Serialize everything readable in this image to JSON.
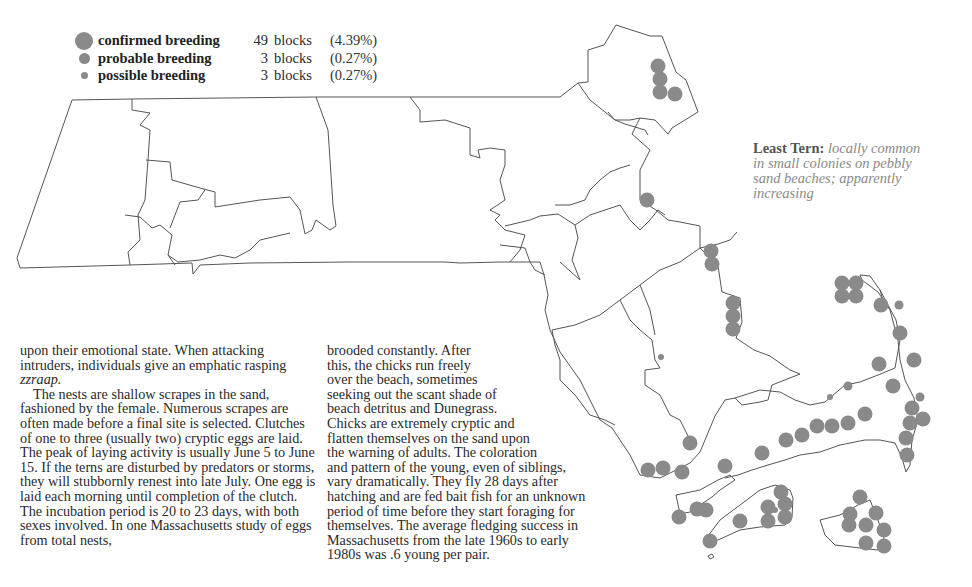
{
  "legend": {
    "dot_color": "#8a8a8a",
    "rows": [
      {
        "label": "confirmed breeding",
        "count": "49",
        "unit": "blocks",
        "percent": "(4.39%)",
        "dot_size": 18
      },
      {
        "label": "probable breeding",
        "count": "3",
        "unit": "blocks",
        "percent": "(0.27%)",
        "dot_size": 11
      },
      {
        "label": "possible breeding",
        "count": "3",
        "unit": "blocks",
        "percent": "(0.27%)",
        "dot_size": 7
      }
    ]
  },
  "species": {
    "name": "Least Tern:",
    "description": " locally common in small colonies on pebbly sand beaches; apparently increasing"
  },
  "text": {
    "left_p1_a": "upon their emotional state. When attacking intruders, individuals give an emphatic rasping ",
    "left_p1_em": "zzraap.",
    "left_p2": "The nests are shallow scrapes in the sand, fashioned by the female. Numerous scrapes are often made before a final site is selected. Clutches of one to three (usually two) cryptic eggs are laid. The peak of laying activity is usually June 5 to June 15. If the terns are disturbed by predators or storms, they will stubbornly renest into late July. One egg is laid each morning until completion of the clutch. The incubation period is 20 to 23 days, with both sexes involved. In one Massachusetts study of eggs from total nests,",
    "mid_lines": [
      "brooded constantly. After",
      "this, the chicks run freely",
      "over the beach, sometimes",
      "seeking out the scant shade of",
      "beach detritus and Dunegrass.",
      "Chicks are extremely cryptic and",
      "flatten themselves on the sand upon",
      "the warning of adults. The coloration",
      "and pattern of the young, even of siblings,",
      "vary dramatically. They fly 28 days after",
      "hatching and are fed bait fish for an unknown",
      "period of time before they start foraging for",
      "themselves. The average fledging success in",
      "Massachusetts from the late 1960s to early",
      "1980s was .6 young per pair."
    ]
  },
  "map": {
    "outline_color": "#555555",
    "dot_color": "#8a8a8a",
    "confirmed_dots": [
      [
        658,
        66
      ],
      [
        660,
        79
      ],
      [
        660,
        92
      ],
      [
        675,
        94
      ],
      [
        647,
        200
      ],
      [
        711,
        251
      ],
      [
        712,
        264
      ],
      [
        733,
        303
      ],
      [
        733,
        316
      ],
      [
        733,
        329
      ],
      [
        842,
        283
      ],
      [
        856,
        283
      ],
      [
        842,
        296
      ],
      [
        856,
        296
      ],
      [
        881,
        305
      ],
      [
        900,
        333
      ],
      [
        914,
        360
      ],
      [
        879,
        364
      ],
      [
        912,
        408
      ],
      [
        910,
        423
      ],
      [
        923,
        419
      ],
      [
        906,
        438
      ],
      [
        907,
        455
      ],
      [
        893,
        386
      ],
      [
        865,
        414
      ],
      [
        848,
        423
      ],
      [
        832,
        426
      ],
      [
        817,
        426
      ],
      [
        802,
        435
      ],
      [
        786,
        440
      ],
      [
        762,
        453
      ],
      [
        725,
        466
      ],
      [
        690,
        443
      ],
      [
        682,
        472
      ],
      [
        663,
        468
      ],
      [
        648,
        470
      ],
      [
        697,
        509
      ],
      [
        706,
        510
      ],
      [
        679,
        517
      ],
      [
        740,
        521
      ],
      [
        710,
        541
      ],
      [
        781,
        492
      ],
      [
        768,
        507
      ],
      [
        768,
        521
      ],
      [
        785,
        504
      ],
      [
        785,
        517
      ],
      [
        860,
        497
      ],
      [
        849,
        525
      ],
      [
        866,
        525
      ],
      [
        876,
        513
      ],
      [
        884,
        530
      ],
      [
        884,
        546
      ],
      [
        866,
        543
      ],
      [
        850,
        514
      ]
    ],
    "probable_dots": [
      [
        899,
        305
      ],
      [
        848,
        386
      ],
      [
        920,
        397
      ]
    ],
    "possible_dots": [
      [
        830,
        397
      ],
      [
        775,
        510
      ],
      [
        661,
        357
      ]
    ]
  }
}
